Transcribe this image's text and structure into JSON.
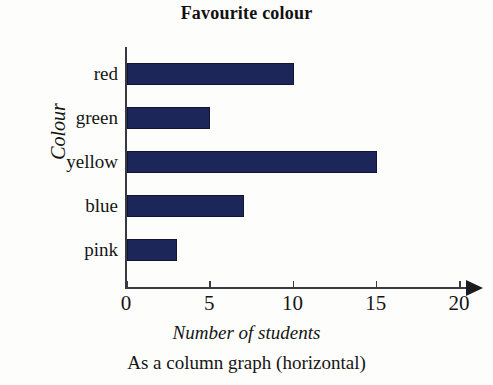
{
  "figure": {
    "title": "Favourite colour",
    "caption": "As a column graph (horizontal)"
  },
  "axes": {
    "y_title": "Colour",
    "x_title": "Number of students"
  },
  "colors": {
    "bar_fill": "#1d2659",
    "bar_edge": "#10163a",
    "axis_line": "#3a3a42",
    "text": "#151515",
    "background": "#fdfdfb"
  },
  "chart_data": {
    "type": "bar",
    "orientation": "horizontal",
    "title": "Favourite colour",
    "xlabel": "Number of students",
    "ylabel": "Colour",
    "categories": [
      "red",
      "green",
      "yellow",
      "blue",
      "pink"
    ],
    "values": [
      10,
      5,
      15,
      7,
      3
    ],
    "xlim": [
      0,
      20
    ],
    "xticks": [
      0,
      5,
      10,
      15,
      20
    ],
    "xtick_labels": [
      "0",
      "5",
      "10",
      "15",
      "20"
    ],
    "grid": false,
    "legend": false,
    "axis_arrow": true
  }
}
